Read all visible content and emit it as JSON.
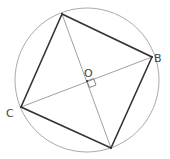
{
  "diagram": {
    "type": "inscribed-square",
    "colors": {
      "background": "#ffffff",
      "circle": "#aaaaaa",
      "square": "#333333",
      "diagonals": "#888888",
      "labels": "#444444"
    },
    "circle": {
      "cx": 87,
      "cy": 80,
      "r": 72
    },
    "vertices": {
      "top": {
        "x": 62,
        "y": 14,
        "label": ""
      },
      "B": {
        "x": 152,
        "y": 57,
        "label": "B"
      },
      "bottom": {
        "x": 111,
        "y": 148,
        "label": ""
      },
      "C": {
        "x": 21,
        "y": 107,
        "label": "C"
      }
    },
    "center": {
      "x": 87,
      "y": 81,
      "label": "O"
    },
    "labels": {
      "B": "B",
      "C": "C",
      "O": "O"
    },
    "right_angle_marker": true
  }
}
